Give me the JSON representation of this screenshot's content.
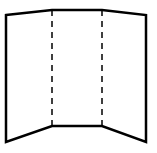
{
  "diagram": {
    "type": "tri-fold-board",
    "colors": {
      "stroke": "#000000",
      "background": "#ffffff"
    },
    "outline_points": "6,15 52,10 102,10 146,15 146,142 102,126 52,126 6,142",
    "fold_lines": [
      {
        "x1": 52,
        "y1": 10,
        "x2": 52,
        "y2": 126
      },
      {
        "x1": 102,
        "y1": 10,
        "x2": 102,
        "y2": 126
      }
    ],
    "panels": [
      "left-panel",
      "center-panel",
      "right-panel"
    ]
  }
}
